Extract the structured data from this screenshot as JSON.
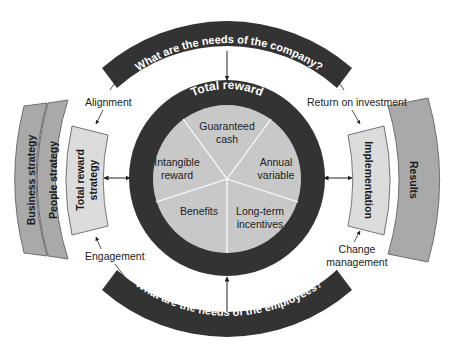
{
  "title": "Total reward",
  "top_band": "What are the needs of the company?",
  "bottom_band": "What are the needs of the employees?",
  "pie_segments": [
    {
      "label_line1": "Guaranteed",
      "label_line2": "cash"
    },
    {
      "label_line1": "Annual",
      "label_line2": "variable"
    },
    {
      "label_line1": "Long-term",
      "label_line2": "incentives"
    },
    {
      "label_line1": "Benefits",
      "label_line2": ""
    },
    {
      "label_line1": "Intangible",
      "label_line2": "reward"
    }
  ],
  "left_panels": {
    "outer1": "Business strategy",
    "outer2": "People strategy",
    "inner_line1": "Total reward",
    "inner_line2": "strategy"
  },
  "right_panels": {
    "inner": "Implementation",
    "outer": "Results"
  },
  "connector_labels": {
    "top_left": "Alignment",
    "top_right": "Return on investment",
    "bottom_left": "Engagement",
    "bottom_right_line1": "Change",
    "bottom_right_line2": "management"
  },
  "colors": {
    "dark": "#333333",
    "pie_fill": "#c8c8c8",
    "panel_light": "#dcdcdc",
    "panel_mid": "#a9a9a9",
    "text": "#222222"
  }
}
